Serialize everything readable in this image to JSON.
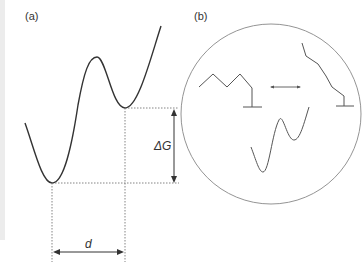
{
  "panels": {
    "a": {
      "label": "(a)",
      "delta_g_label": "ΔG",
      "distance_label": "d"
    },
    "b": {
      "label": "(b)"
    }
  },
  "colors": {
    "curve": "#333333",
    "dotted": "#777777",
    "circle": "#888888",
    "strip": "#ececec"
  }
}
